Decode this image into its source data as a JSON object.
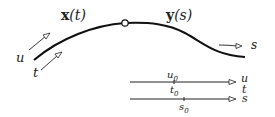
{
  "diagram": {
    "curve": {
      "left_label_bold": "x",
      "left_label_arg": "(t)",
      "right_label_bold": "y",
      "right_label_arg": "(s)",
      "junction_marker": "open-circle"
    },
    "left_arrows": [
      {
        "label": "u"
      },
      {
        "label": "t"
      }
    ],
    "right_arrow": {
      "label": "s"
    },
    "axes": [
      {
        "name": "u/t axis",
        "tick_above": "u",
        "tick_above_sub": "0",
        "tick_below": "t",
        "tick_below_sub": "0",
        "end_label_top": "u",
        "end_label_bottom": "t"
      },
      {
        "name": "s axis",
        "tick_below": "s",
        "tick_below_sub": "0",
        "end_label": "s"
      }
    ],
    "colors": {
      "stroke": "#111111",
      "background": "#ffffff"
    }
  }
}
